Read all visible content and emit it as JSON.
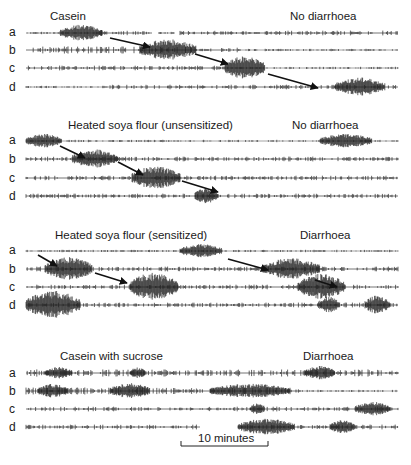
{
  "figure": {
    "row_labels": [
      "a",
      "b",
      "c",
      "d"
    ],
    "scale_bar": {
      "label": "10 minutes",
      "x1": 181,
      "x2": 268,
      "y": 446
    },
    "trace_x_start": 26,
    "trace_x_end": 398,
    "panels": [
      {
        "title": "Casein",
        "outcome": "No diarrhoea",
        "title_x": 50,
        "outcome_x": 290,
        "label_y": 20,
        "rows_y": [
          33,
          50,
          68,
          87
        ],
        "rows": [
          {
            "segments": [
              [
                26,
                100,
                1
              ],
              [
                100,
                102,
                6
              ],
              [
                102,
                152,
                2
              ],
              [
                158,
                175,
                1
              ],
              [
                180,
                398,
                2
              ]
            ],
            "bursts": [
              [
                60,
                102,
                7
              ]
            ]
          },
          {
            "segments": [
              [
                26,
                200,
                3
              ],
              [
                200,
                240,
                2
              ],
              [
                240,
                398,
                1
              ]
            ],
            "bursts": [
              [
                140,
                196,
                9
              ]
            ]
          },
          {
            "segments": [
              [
                26,
                225,
                2
              ],
              [
                225,
                398,
                1
              ]
            ],
            "bursts": [
              [
                225,
                265,
                10
              ]
            ]
          },
          {
            "segments": [
              [
                26,
                110,
                1
              ],
              [
                110,
                398,
                2
              ]
            ],
            "bursts": [
              [
                335,
                385,
                8
              ]
            ]
          }
        ],
        "arrows": [
          [
            110,
            38,
            150,
            47
          ],
          [
            195,
            54,
            228,
            64
          ],
          [
            268,
            74,
            318,
            88
          ]
        ]
      },
      {
        "title": "Heated soya flour (unsensitized)",
        "outcome": "No diarrhoea",
        "title_x": 68,
        "outcome_x": 292,
        "label_y": 129,
        "rows_y": [
          141,
          159,
          178,
          196
        ],
        "rows": [
          {
            "segments": [
              [
                26,
                398,
                1
              ]
            ],
            "bursts": [
              [
                26,
                62,
                6
              ],
              [
                320,
                372,
                6
              ]
            ]
          },
          {
            "segments": [
              [
                26,
                398,
                2
              ]
            ],
            "bursts": [
              [
                72,
                118,
                8
              ]
            ]
          },
          {
            "segments": [
              [
                26,
                398,
                2
              ]
            ],
            "bursts": [
              [
                132,
                180,
                10
              ]
            ]
          },
          {
            "segments": [
              [
                26,
                398,
                2
              ]
            ],
            "bursts": [
              [
                195,
                218,
                7
              ]
            ]
          }
        ],
        "arrows": [
          [
            60,
            146,
            85,
            158
          ],
          [
            118,
            162,
            143,
            175
          ],
          [
            182,
            181,
            218,
            192
          ]
        ]
      },
      {
        "title": "Heated soya flour (sensitized)",
        "outcome": "Diarrhoea",
        "title_x": 55,
        "outcome_x": 300,
        "label_y": 239,
        "rows_y": [
          251,
          269,
          287,
          305
        ],
        "rows": [
          {
            "segments": [
              [
                26,
                398,
                1
              ]
            ],
            "bursts": [
              [
                180,
                222,
                6
              ]
            ]
          },
          {
            "segments": [
              [
                26,
                398,
                2
              ]
            ],
            "bursts": [
              [
                45,
                92,
                10
              ],
              [
                262,
                320,
                9
              ]
            ]
          },
          {
            "segments": [
              [
                26,
                398,
                2
              ]
            ],
            "bursts": [
              [
                130,
                178,
                12
              ],
              [
                298,
                345,
                11
              ]
            ]
          },
          {
            "segments": [
              [
                26,
                398,
                2
              ]
            ],
            "bursts": [
              [
                26,
                80,
                12
              ],
              [
                318,
                340,
                7
              ],
              [
                365,
                390,
                8
              ]
            ]
          }
        ],
        "arrows": [
          [
            38,
            255,
            57,
            266
          ],
          [
            95,
            273,
            127,
            283
          ],
          [
            228,
            259,
            268,
            270
          ],
          [
            315,
            280,
            337,
            287
          ]
        ]
      },
      {
        "title": "Casein with sucrose",
        "outcome": "Diarrhoea",
        "title_x": 60,
        "outcome_x": 303,
        "label_y": 360,
        "rows_y": [
          373,
          391,
          409,
          427
        ],
        "rows": [
          {
            "segments": [
              [
                26,
                398,
                3
              ]
            ],
            "bursts": [
              [
                45,
                72,
                5
              ],
              [
                130,
                145,
                5
              ],
              [
                305,
                335,
                6
              ]
            ]
          },
          {
            "segments": [
              [
                26,
                300,
                3
              ],
              [
                300,
                398,
                1
              ]
            ],
            "bursts": [
              [
                38,
                68,
                6
              ],
              [
                110,
                150,
                7
              ],
              [
                210,
                290,
                6
              ]
            ]
          },
          {
            "segments": [
              [
                26,
                398,
                2
              ]
            ],
            "bursts": [
              [
                250,
                265,
                5
              ],
              [
                355,
                390,
                6
              ]
            ]
          },
          {
            "segments": [
              [
                26,
                200,
                2
              ],
              [
                238,
                398,
                2
              ]
            ],
            "bursts": [
              [
                238,
                295,
                7
              ],
              [
                330,
                355,
                6
              ]
            ]
          }
        ],
        "arrows": []
      }
    ]
  }
}
